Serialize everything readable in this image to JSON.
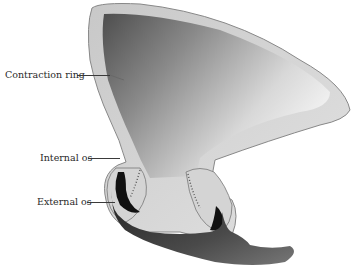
{
  "figure": {
    "labels": [
      {
        "id": "contraction-ring",
        "text": "Contraction ring"
      },
      {
        "id": "internal-os",
        "text": "Internal os"
      },
      {
        "id": "external-os",
        "text": "External os"
      }
    ],
    "colors": {
      "background": "#ffffff",
      "wall": "#d9d9d9",
      "cavity_dark": "#5a5a5a",
      "cavity_light": "#f2f2f2",
      "cervix_canal": "#111111",
      "vagina": "#3b3b3b",
      "outline": "#555555"
    }
  }
}
